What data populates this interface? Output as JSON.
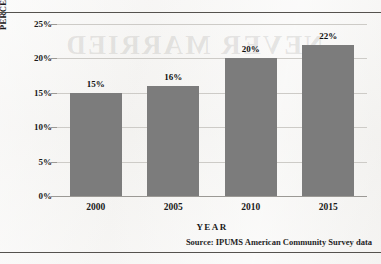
{
  "page": {
    "background_color": "#f3f2f0",
    "rule_color": "#55524e",
    "bleed_through_text": "NEVER MARRIED"
  },
  "source_note": "Source:  IPUMS American Community Survey data",
  "chart_data": {
    "type": "bar",
    "title": "",
    "subtitle": "",
    "categories": [
      "2000",
      "2005",
      "2010",
      "2015"
    ],
    "values": [
      15,
      16,
      20,
      22
    ],
    "data_labels": [
      "15%",
      "16%",
      "20%",
      "22%"
    ],
    "xlabel": "YEAR",
    "ylabel": "PERCENTAGE OF U.S. ADULTS",
    "ylim": [
      0,
      25
    ],
    "ytick_values": [
      0,
      5,
      10,
      15,
      20,
      25
    ],
    "ytick_labels": [
      "0%",
      "5%",
      "10%",
      "15%",
      "20%",
      "25%"
    ],
    "grid": true,
    "grid_axis": "y",
    "grid_color": "#cdcbc7",
    "legend": false,
    "legend_position": "none",
    "bar_color": "#7c7c7c",
    "axis_color": "#9b9995",
    "unit": "percent"
  }
}
